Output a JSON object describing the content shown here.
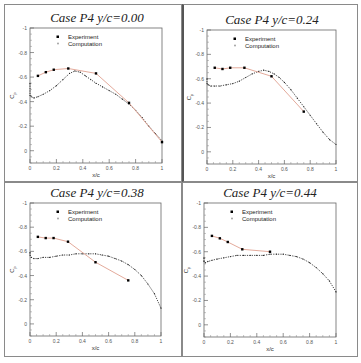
{
  "figure": {
    "panel_border_color": "#8a8a8a",
    "experiment_line_color": "#e0a090",
    "experiment_marker_color": "#000000",
    "computation_color": "#333333"
  },
  "chart_data": [
    {
      "type": "line",
      "title": "Case P4  y/c=0.00",
      "xlabel": "x/c",
      "ylabel": "Cp",
      "xlim": [
        0,
        1
      ],
      "ylim": [
        0,
        -1
      ],
      "y_inverted": true,
      "xticks": [
        "0",
        "0.2",
        "0.4",
        "0.6",
        "0.8",
        "1"
      ],
      "yticks": [
        "-1",
        "-0.8",
        "-0.6",
        "-0.4",
        "-0.2",
        "0"
      ],
      "legend": [
        "Experiment",
        "Computation"
      ],
      "legend_position": "upper-left",
      "grid": false,
      "series": [
        {
          "name": "Experiment",
          "x": [
            0.06,
            0.12,
            0.18,
            0.29,
            0.5,
            0.75,
            1.0
          ],
          "y": [
            -0.61,
            -0.64,
            -0.66,
            -0.67,
            -0.63,
            -0.39,
            -0.07
          ]
        },
        {
          "name": "Computation",
          "x": [
            0.0,
            0.0,
            0.01,
            0.03,
            0.06,
            0.1,
            0.15,
            0.2,
            0.25,
            0.3,
            0.34,
            0.38,
            0.42,
            0.46,
            0.5,
            0.55,
            0.6,
            0.65,
            0.7,
            0.75,
            0.8,
            0.85,
            0.9,
            0.95,
            1.0
          ],
          "y": [
            -0.55,
            -0.45,
            -0.44,
            -0.43,
            -0.44,
            -0.46,
            -0.49,
            -0.53,
            -0.58,
            -0.63,
            -0.65,
            -0.64,
            -0.61,
            -0.58,
            -0.55,
            -0.52,
            -0.49,
            -0.46,
            -0.42,
            -0.38,
            -0.33,
            -0.27,
            -0.2,
            -0.14,
            -0.08
          ]
        }
      ]
    },
    {
      "type": "line",
      "title": "Case P4  y/c=0.24",
      "xlabel": "x/c",
      "ylabel": "Cp",
      "xlim": [
        0,
        1
      ],
      "ylim": [
        0,
        -1
      ],
      "y_inverted": true,
      "xticks": [
        "0",
        "0.2",
        "0.4",
        "0.6",
        "0.8",
        "1"
      ],
      "yticks": [
        "-1",
        "-0.8",
        "-0.6",
        "-0.4",
        "-0.2",
        "0"
      ],
      "legend": [
        "Experiment",
        "Computation"
      ],
      "legend_position": "upper-left",
      "grid": false,
      "series": [
        {
          "name": "Experiment",
          "x": [
            0.06,
            0.12,
            0.18,
            0.29,
            0.5,
            0.75
          ],
          "y": [
            -0.69,
            -0.68,
            -0.69,
            -0.69,
            -0.62,
            -0.33
          ]
        },
        {
          "name": "Computation",
          "x": [
            0.0,
            0.0,
            0.01,
            0.03,
            0.06,
            0.1,
            0.15,
            0.2,
            0.25,
            0.3,
            0.35,
            0.4,
            0.44,
            0.48,
            0.52,
            0.56,
            0.6,
            0.65,
            0.7,
            0.75,
            0.8,
            0.85,
            0.9,
            0.95,
            1.0
          ],
          "y": [
            -0.6,
            -0.56,
            -0.55,
            -0.54,
            -0.54,
            -0.54,
            -0.55,
            -0.56,
            -0.58,
            -0.61,
            -0.64,
            -0.66,
            -0.67,
            -0.66,
            -0.64,
            -0.61,
            -0.57,
            -0.51,
            -0.44,
            -0.37,
            -0.3,
            -0.23,
            -0.16,
            -0.1,
            -0.06
          ]
        }
      ]
    },
    {
      "type": "line",
      "title": "Case P4  y/c=0.38",
      "xlabel": "x/c",
      "ylabel": "Cp",
      "xlim": [
        0,
        1
      ],
      "ylim": [
        0,
        -1
      ],
      "y_inverted": true,
      "xticks": [
        "0",
        "0.2",
        "0.4",
        "0.6",
        "0.8",
        "1"
      ],
      "yticks": [
        "-1",
        "-0.8",
        "-0.6",
        "-0.4",
        "-0.2",
        "0"
      ],
      "legend": [
        "Experiment",
        "Computation"
      ],
      "legend_position": "upper-left",
      "grid": false,
      "series": [
        {
          "name": "Experiment",
          "x": [
            0.06,
            0.12,
            0.18,
            0.29,
            0.5,
            0.75
          ],
          "y": [
            -0.72,
            -0.71,
            -0.71,
            -0.68,
            -0.51,
            -0.36
          ]
        },
        {
          "name": "Computation",
          "x": [
            0.0,
            0.0,
            0.01,
            0.03,
            0.06,
            0.1,
            0.15,
            0.2,
            0.25,
            0.3,
            0.35,
            0.4,
            0.45,
            0.5,
            0.55,
            0.6,
            0.65,
            0.7,
            0.75,
            0.8,
            0.85,
            0.9,
            0.95,
            1.0
          ],
          "y": [
            -0.59,
            -0.57,
            -0.55,
            -0.54,
            -0.54,
            -0.55,
            -0.55,
            -0.56,
            -0.57,
            -0.57,
            -0.58,
            -0.58,
            -0.58,
            -0.58,
            -0.57,
            -0.56,
            -0.54,
            -0.52,
            -0.49,
            -0.45,
            -0.4,
            -0.33,
            -0.25,
            -0.13
          ]
        }
      ]
    },
    {
      "type": "line",
      "title": "Case P4  y/c=0.44",
      "xlabel": "x/c",
      "ylabel": "Cp",
      "xlim": [
        0,
        1
      ],
      "ylim": [
        0,
        -1
      ],
      "y_inverted": true,
      "xticks": [
        "0",
        "0.2",
        "0.4",
        "0.6",
        "0.8",
        "1"
      ],
      "yticks": [
        "-1",
        "-0.8",
        "-0.6",
        "-0.4",
        "-0.2",
        "0"
      ],
      "legend": [
        "Experiment",
        "Computation"
      ],
      "legend_position": "upper-left",
      "grid": false,
      "series": [
        {
          "name": "Experiment",
          "x": [
            0.06,
            0.12,
            0.18,
            0.29,
            0.5
          ],
          "y": [
            -0.73,
            -0.71,
            -0.68,
            -0.62,
            -0.6
          ]
        },
        {
          "name": "Computation",
          "x": [
            0.0,
            0.0,
            0.01,
            0.03,
            0.06,
            0.1,
            0.15,
            0.2,
            0.25,
            0.3,
            0.35,
            0.4,
            0.45,
            0.5,
            0.55,
            0.6,
            0.65,
            0.7,
            0.75,
            0.8,
            0.85,
            0.9,
            0.95,
            1.0
          ],
          "y": [
            -0.55,
            -0.52,
            -0.51,
            -0.52,
            -0.53,
            -0.54,
            -0.55,
            -0.56,
            -0.57,
            -0.57,
            -0.57,
            -0.57,
            -0.57,
            -0.58,
            -0.58,
            -0.58,
            -0.57,
            -0.56,
            -0.54,
            -0.51,
            -0.47,
            -0.42,
            -0.36,
            -0.27
          ]
        }
      ]
    }
  ]
}
